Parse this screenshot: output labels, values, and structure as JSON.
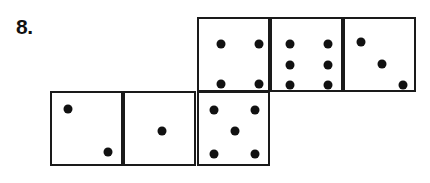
{
  "problem": {
    "number_label": "8."
  },
  "net": {
    "faces": [
      {
        "id": "top-1",
        "value": 4,
        "col": 2,
        "row": 0,
        "pips": [
          [
            22,
            25
          ],
          [
            60,
            25
          ],
          [
            22,
            65
          ],
          [
            60,
            65
          ]
        ]
      },
      {
        "id": "top-2",
        "value": 6,
        "col": 3,
        "row": 0,
        "pips": [
          [
            18,
            25
          ],
          [
            56,
            25
          ],
          [
            18,
            46
          ],
          [
            56,
            46
          ],
          [
            18,
            66
          ],
          [
            56,
            66
          ]
        ]
      },
      {
        "id": "top-3",
        "value": 3,
        "col": 4,
        "row": 0,
        "pips": [
          [
            16,
            23
          ],
          [
            37,
            45
          ],
          [
            58,
            66
          ]
        ]
      },
      {
        "id": "bottom-1",
        "value": 2,
        "col": 0,
        "row": 1,
        "pips": [
          [
            16,
            16
          ],
          [
            56,
            59
          ]
        ]
      },
      {
        "id": "bottom-2",
        "value": 1,
        "col": 1,
        "row": 1,
        "pips": [
          [
            37,
            38
          ]
        ]
      },
      {
        "id": "bottom-3",
        "value": 5,
        "col": 2,
        "row": 1,
        "pips": [
          [
            15,
            17
          ],
          [
            56,
            17
          ],
          [
            36,
            38
          ],
          [
            15,
            61
          ],
          [
            56,
            61
          ]
        ]
      }
    ]
  },
  "colors": {
    "line": "#1a1a1a",
    "pip": "#111111",
    "background": "#ffffff"
  }
}
